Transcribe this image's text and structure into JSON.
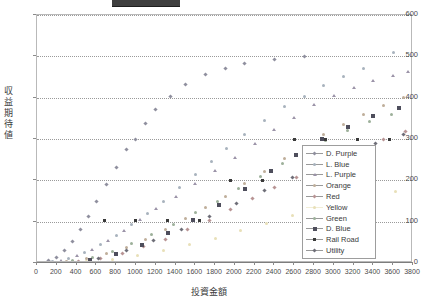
{
  "window": {
    "top_bar_present": true
  },
  "chart_data": {
    "type": "scatter",
    "title": "",
    "xlabel": "投資金額",
    "ylabel": "収益期待値",
    "xlim": [
      0,
      3800
    ],
    "ylim": [
      0,
      600
    ],
    "xticks": [
      0,
      200,
      400,
      600,
      800,
      1000,
      1200,
      1400,
      1600,
      1800,
      2000,
      2200,
      2400,
      2600,
      2800,
      3000,
      3200,
      3400,
      3600,
      3800
    ],
    "yticks": [
      0,
      100,
      200,
      300,
      400,
      500,
      600
    ],
    "grid": "horizontal-dotted",
    "legend_position": "inside-right-middle",
    "series": [
      {
        "name": "D. Purple",
        "color": "#8f8f9e",
        "marker": "diamond",
        "points": [
          [
            120,
            5
          ],
          [
            200,
            14
          ],
          [
            280,
            30
          ],
          [
            360,
            52
          ],
          [
            440,
            80
          ],
          [
            520,
            112
          ],
          [
            600,
            148
          ],
          [
            700,
            190
          ],
          [
            800,
            232
          ],
          [
            900,
            275
          ],
          [
            1000,
            300
          ],
          [
            1100,
            338
          ],
          [
            1200,
            372
          ],
          [
            1350,
            402
          ],
          [
            1500,
            432
          ],
          [
            1700,
            455
          ],
          [
            1900,
            470
          ],
          [
            2100,
            482
          ],
          [
            2400,
            492
          ],
          [
            2700,
            500
          ]
        ]
      },
      {
        "name": "L. Blue",
        "color": "#a8b2bd",
        "marker": "circle",
        "points": [
          [
            160,
            4
          ],
          [
            320,
            12
          ],
          [
            480,
            26
          ],
          [
            640,
            44
          ],
          [
            800,
            66
          ],
          [
            960,
            92
          ],
          [
            1120,
            120
          ],
          [
            1280,
            150
          ],
          [
            1440,
            182
          ],
          [
            1600,
            214
          ],
          [
            1760,
            246
          ],
          [
            1920,
            278
          ],
          [
            2100,
            310
          ],
          [
            2300,
            344
          ],
          [
            2500,
            378
          ],
          [
            2700,
            404
          ],
          [
            2900,
            430
          ],
          [
            3100,
            452
          ],
          [
            3300,
            470
          ],
          [
            3600,
            510
          ]
        ]
      },
      {
        "name": "L. Purple",
        "color": "#9b93a8",
        "marker": "triangle",
        "points": [
          [
            240,
            6
          ],
          [
            400,
            16
          ],
          [
            560,
            32
          ],
          [
            720,
            54
          ],
          [
            880,
            78
          ],
          [
            1040,
            104
          ],
          [
            1200,
            130
          ],
          [
            1400,
            160
          ],
          [
            1600,
            190
          ],
          [
            1800,
            222
          ],
          [
            2000,
            254
          ],
          [
            2200,
            288
          ],
          [
            2400,
            322
          ],
          [
            2600,
            352
          ],
          [
            2800,
            382
          ],
          [
            3000,
            404
          ],
          [
            3200,
            424
          ],
          [
            3400,
            440
          ],
          [
            3600,
            452
          ],
          [
            3750,
            462
          ]
        ]
      },
      {
        "name": "Orange",
        "color": "#bfae9a",
        "marker": "circle",
        "points": [
          [
            300,
            3
          ],
          [
            500,
            10
          ],
          [
            700,
            22
          ],
          [
            900,
            38
          ],
          [
            1100,
            58
          ],
          [
            1300,
            82
          ],
          [
            1500,
            108
          ],
          [
            1700,
            134
          ],
          [
            1900,
            162
          ],
          [
            2100,
            192
          ],
          [
            2300,
            222
          ],
          [
            2500,
            252
          ],
          [
            2700,
            282
          ],
          [
            2900,
            310
          ],
          [
            3100,
            336
          ],
          [
            3300,
            360
          ],
          [
            3500,
            382
          ],
          [
            3700,
            400
          ]
        ]
      },
      {
        "name": "Red",
        "color": "#b89494",
        "marker": "diamond",
        "points": [
          [
            420,
            4
          ],
          [
            640,
            12
          ],
          [
            860,
            24
          ],
          [
            1080,
            40
          ],
          [
            1300,
            58
          ],
          [
            1520,
            80
          ],
          [
            1740,
            104
          ],
          [
            1960,
            130
          ],
          [
            2180,
            156
          ],
          [
            2400,
            182
          ],
          [
            2620,
            208
          ],
          [
            2840,
            234
          ],
          [
            3060,
            258
          ],
          [
            3280,
            280
          ],
          [
            3500,
            300
          ],
          [
            3720,
            318
          ]
        ]
      },
      {
        "name": "Yellow",
        "color": "#e8e0b8",
        "marker": "circle",
        "points": [
          [
            500,
            3
          ],
          [
            760,
            9
          ],
          [
            1020,
            18
          ],
          [
            1280,
            30
          ],
          [
            1540,
            44
          ],
          [
            1800,
            60
          ],
          [
            2060,
            78
          ],
          [
            2320,
            96
          ],
          [
            2580,
            114
          ],
          [
            2840,
            132
          ],
          [
            3100,
            148
          ],
          [
            3360,
            162
          ],
          [
            3620,
            174
          ]
        ]
      },
      {
        "name": "Green",
        "color": "#9db09a",
        "marker": "circle",
        "points": [
          [
            360,
            5
          ],
          [
            560,
            14
          ],
          [
            760,
            28
          ],
          [
            960,
            46
          ],
          [
            1160,
            68
          ],
          [
            1380,
            94
          ],
          [
            1600,
            122
          ],
          [
            1820,
            150
          ],
          [
            2040,
            180
          ],
          [
            2260,
            210
          ],
          [
            2480,
            240
          ],
          [
            2700,
            268
          ],
          [
            2920,
            296
          ],
          [
            3140,
            320
          ],
          [
            3360,
            342
          ],
          [
            3580,
            360
          ]
        ]
      },
      {
        "name": "D. Blue",
        "color": "#4e4e5c",
        "marker": "square-large",
        "points": [
          [
            540,
            8
          ],
          [
            800,
            22
          ],
          [
            1060,
            44
          ],
          [
            1320,
            72
          ],
          [
            1580,
            104
          ],
          [
            1840,
            140
          ],
          [
            2100,
            180
          ],
          [
            2360,
            222
          ],
          [
            2620,
            262
          ],
          [
            2880,
            300
          ],
          [
            3140,
            330
          ],
          [
            3400,
            356
          ],
          [
            3660,
            376
          ]
        ]
      },
      {
        "name": "Rail Road",
        "color": "#3a3a3a",
        "marker": "square",
        "points": [
          [
            680,
            104
          ],
          [
            1000,
            104
          ],
          [
            1320,
            104
          ],
          [
            1640,
            104
          ],
          [
            1960,
            200
          ],
          [
            2280,
            200
          ],
          [
            2600,
            300
          ],
          [
            2920,
            300
          ],
          [
            3240,
            300
          ],
          [
            3560,
            300
          ]
        ]
      },
      {
        "name": "Utility",
        "color": "#6e6e78",
        "marker": "diamond",
        "points": [
          [
            620,
            12
          ],
          [
            900,
            30
          ],
          [
            1180,
            54
          ],
          [
            1460,
            82
          ],
          [
            1740,
            112
          ],
          [
            2020,
            144
          ],
          [
            2300,
            176
          ],
          [
            2580,
            208
          ],
          [
            2860,
            238
          ],
          [
            3140,
            266
          ],
          [
            3420,
            290
          ],
          [
            3700,
            312
          ]
        ]
      }
    ]
  },
  "legend": {
    "entries": [
      {
        "label": "D. Purple"
      },
      {
        "label": "L. Blue"
      },
      {
        "label": "L. Purple"
      },
      {
        "label": "Orange"
      },
      {
        "label": "Red"
      },
      {
        "label": "Yellow"
      },
      {
        "label": "Green"
      },
      {
        "label": "D. Blue"
      },
      {
        "label": "Rail Road"
      },
      {
        "label": "Utility"
      }
    ]
  }
}
